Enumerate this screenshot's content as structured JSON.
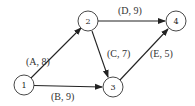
{
  "nodes": [
    {
      "id": "1",
      "label": "1",
      "x": 24,
      "y": 85
    },
    {
      "id": "2",
      "label": "2",
      "x": 88,
      "y": 21
    },
    {
      "id": "3",
      "label": "3",
      "x": 113,
      "y": 87
    },
    {
      "id": "4",
      "label": "4",
      "x": 176,
      "y": 21
    }
  ],
  "edges": [
    {
      "from": "1",
      "to": "2",
      "activity": "A",
      "duration": 8,
      "label": "(A, 8)"
    },
    {
      "from": "1",
      "to": "3",
      "activity": "B",
      "duration": 9,
      "label": "(B, 9)"
    },
    {
      "from": "2",
      "to": "3",
      "activity": "C",
      "duration": 7,
      "label": "(C, 7)"
    },
    {
      "from": "2",
      "to": "4",
      "activity": "D",
      "duration": 9,
      "label": "(D, 9)"
    },
    {
      "from": "3",
      "to": "4",
      "activity": "E",
      "duration": 5,
      "label": "(E, 5)"
    }
  ]
}
